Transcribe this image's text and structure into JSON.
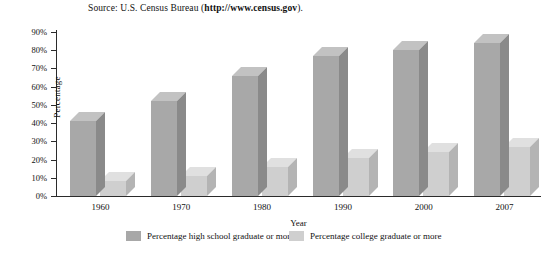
{
  "source_note": {
    "prefix": "Source: U.S. Census Bureau (",
    "url": "http://www.census.gov",
    "suffix": ")."
  },
  "colors": {
    "series1_front": "#a8a8a8",
    "series1_top": "#c2c2c2",
    "series1_side": "#8a8a8a",
    "series2_front": "#cfcfcf",
    "series2_top": "#e0e0e0",
    "series2_side": "#b4b4b4",
    "axis": "#2b2b2b",
    "text": "#111111",
    "background": "#ffffff"
  },
  "chart_data": {
    "type": "bar",
    "title": "",
    "subtitle": "",
    "xlabel": "Year",
    "ylabel": "Percentage",
    "categories": [
      "1960",
      "1970",
      "1980",
      "1990",
      "2000",
      "2007"
    ],
    "series": [
      {
        "name": "Percentage high school graduate or more",
        "values": [
          41,
          52,
          66,
          77,
          80,
          84
        ]
      },
      {
        "name": "Percentage college graduate or more",
        "values": [
          8,
          11,
          16,
          21,
          24,
          27
        ]
      }
    ],
    "ylim": [
      0,
      90
    ],
    "ytick_values": [
      0,
      10,
      20,
      30,
      40,
      50,
      60,
      70,
      80,
      90
    ],
    "ytick_labels": [
      "0%",
      "10%",
      "20%",
      "30%",
      "40%",
      "50%",
      "60%",
      "70%",
      "80%",
      "90%"
    ],
    "grid": false,
    "legend_position": "bottom",
    "style": "3d-grouped-bar"
  }
}
